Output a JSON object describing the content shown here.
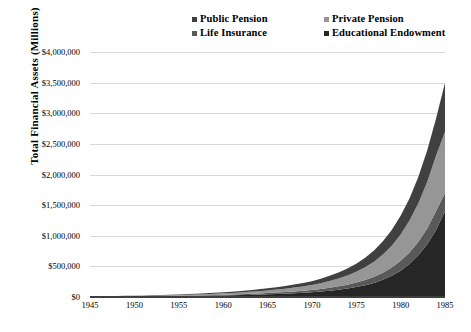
{
  "chart_data": {
    "type": "area",
    "stacked": true,
    "title": "",
    "xlabel": "",
    "ylabel": "Total Financial Assets (Millions)",
    "x": [
      1945,
      1946,
      1947,
      1948,
      1949,
      1950,
      1951,
      1952,
      1953,
      1954,
      1955,
      1956,
      1957,
      1958,
      1959,
      1960,
      1961,
      1962,
      1963,
      1964,
      1965,
      1966,
      1967,
      1968,
      1969,
      1970,
      1971,
      1972,
      1973,
      1974,
      1975,
      1976,
      1977,
      1978,
      1979,
      1980,
      1981,
      1982,
      1983,
      1984,
      1985
    ],
    "xlim": [
      1945,
      1985
    ],
    "ylim": [
      0,
      4000000
    ],
    "ytick_values": [
      0,
      500000,
      1000000,
      1500000,
      2000000,
      2500000,
      3000000,
      3500000,
      4000000
    ],
    "ytick_labels": [
      "$0",
      "$500,000",
      "$1,000,000",
      "$1,500,000",
      "$2,000,000",
      "$2,500,000",
      "$3,000,000",
      "$3,500,000",
      "$4,000,000"
    ],
    "xtick_values": [
      1945,
      1950,
      1955,
      1960,
      1965,
      1970,
      1975,
      1980,
      1985
    ],
    "xtick_labels": [
      "1945",
      "1950",
      "1955",
      "1960",
      "1965",
      "1970",
      "1975",
      "1980",
      "1985"
    ],
    "grid": "horizontal",
    "legend_position": "top",
    "series": [
      {
        "name": "Educational Endowment",
        "color": "#262626",
        "order": 0,
        "values": [
          4000,
          4600,
          5200,
          5900,
          6600,
          7500,
          8500,
          9600,
          10800,
          12200,
          13900,
          15600,
          17400,
          19600,
          22000,
          24500,
          27500,
          30800,
          34500,
          38800,
          43500,
          48500,
          54500,
          61500,
          69000,
          78000,
          90000,
          104000,
          120000,
          139000,
          162000,
          192000,
          230000,
          280000,
          345000,
          430000,
          540000,
          680000,
          860000,
          1100000,
          1400000
        ]
      },
      {
        "name": "Life Insurance",
        "color": "#595959",
        "order": 1,
        "values": [
          2000,
          2300,
          2600,
          2900,
          3300,
          3700,
          4200,
          4700,
          5300,
          6000,
          6800,
          7600,
          8500,
          9500,
          10700,
          12000,
          13400,
          15000,
          16800,
          18800,
          21000,
          23500,
          26200,
          29500,
          33000,
          37000,
          42000,
          48000,
          55000,
          63000,
          73000,
          85000,
          99000,
          116000,
          136000,
          160000,
          188000,
          222000,
          262000,
          310000,
          300000
        ]
      },
      {
        "name": "Private Pension",
        "color": "#969696",
        "order": 2,
        "values": [
          3000,
          3500,
          4000,
          4600,
          5300,
          6100,
          7000,
          8000,
          9200,
          10500,
          12000,
          13700,
          15600,
          17800,
          20300,
          23000,
          26000,
          29500,
          33500,
          38000,
          43000,
          48500,
          55000,
          62500,
          71000,
          81000,
          94000,
          110000,
          128000,
          150000,
          176000,
          208000,
          248000,
          296000,
          356000,
          430000,
          520000,
          630000,
          760000,
          900000,
          1000000
        ]
      },
      {
        "name": "Public Pension",
        "color": "#404040",
        "order": 3,
        "values": [
          2500,
          2900,
          3300,
          3800,
          4400,
          5000,
          5700,
          6500,
          7400,
          8500,
          9700,
          11000,
          12500,
          14200,
          16200,
          18400,
          20800,
          23500,
          26600,
          30100,
          34000,
          38300,
          43200,
          48800,
          55200,
          62500,
          72000,
          84000,
          98000,
          114000,
          133000,
          156000,
          184000,
          218000,
          258000,
          305000,
          362000,
          430000,
          512000,
          610000,
          800000
        ]
      }
    ]
  },
  "legend": {
    "items": [
      {
        "label": "Public Pension",
        "color": "#404040"
      },
      {
        "label": "Private Pension",
        "color": "#969696"
      },
      {
        "label": "Life Insurance",
        "color": "#595959"
      },
      {
        "label": "Educational Endowment",
        "color": "#262626"
      }
    ]
  },
  "axis": {
    "y_title": "Total Financial Assets (Millions)"
  },
  "colors": {
    "gridline": "#d9d9d9",
    "axis": "#3f3f3f",
    "background": "#ffffff"
  }
}
